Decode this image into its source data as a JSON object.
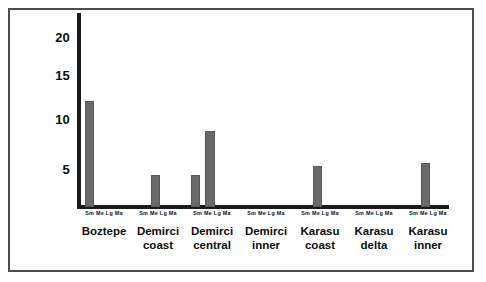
{
  "figure": {
    "background_color": "#ffffff",
    "frame_color": "#4c4c4c",
    "axis_color": "#1a1a1a",
    "bar_color": "#6a6a6a"
  },
  "axis": {
    "y_ticks": [
      "20",
      "15",
      "10",
      "5"
    ],
    "sub_tick_label": "Sm Me Lg Ma"
  },
  "chart_data": {
    "type": "bar",
    "title": "",
    "xlabel": "",
    "ylabel": "",
    "ylim": [
      0,
      22
    ],
    "grid": false,
    "legend": "none",
    "y_tick_values": [
      5,
      10,
      15,
      20
    ],
    "subcategories": [
      "Sm",
      "Me",
      "Lg",
      "Ma"
    ],
    "categories": [
      "Boztepe",
      "Demirci coast",
      "Demirci central",
      "Demirci inner",
      "Karasu coast",
      "Karasu delta",
      "Karasu inner"
    ],
    "series": [
      {
        "name": "Sm",
        "values": [
          12.5,
          0,
          3.8,
          0,
          0,
          0,
          0
        ]
      },
      {
        "name": "Me",
        "values": [
          0,
          3.8,
          9.0,
          0,
          4.8,
          0,
          5.2
        ]
      },
      {
        "name": "Lg",
        "values": [
          0,
          0,
          0,
          0,
          0,
          0,
          0
        ]
      },
      {
        "name": "Ma",
        "values": [
          0,
          0,
          0,
          0,
          0,
          0,
          0
        ]
      }
    ]
  },
  "groups": [
    {
      "label": "Boztepe",
      "label_line1": "Boztepe",
      "label_line2": "",
      "subticks": "Sm Me Lg Ma",
      "left": 77,
      "width": 54,
      "bars": [
        {
          "sub": "Sm",
          "value": 12.5,
          "x": 8,
          "w": 9
        }
      ]
    },
    {
      "label": "Demirci coast",
      "label_line1": "Demirci",
      "label_line2": "coast",
      "subticks": "Sm Me Lg Ma",
      "left": 131,
      "width": 54,
      "bars": [
        {
          "sub": "Me",
          "value": 3.8,
          "x": 20,
          "w": 9
        }
      ]
    },
    {
      "label": "Demirci central",
      "label_line1": "Demirci",
      "label_line2": "central",
      "subticks": "Sm Me Lg Ma",
      "left": 185,
      "width": 54,
      "bars": [
        {
          "sub": "Sm",
          "value": 3.8,
          "x": 6,
          "w": 9
        },
        {
          "sub": "Me",
          "value": 9.0,
          "x": 20,
          "w": 10
        }
      ]
    },
    {
      "label": "Demirci inner",
      "label_line1": "Demirci",
      "label_line2": "inner",
      "subticks": "Sm Me Lg Ma",
      "left": 239,
      "width": 54,
      "bars": []
    },
    {
      "label": "Karasu coast",
      "label_line1": "Karasu",
      "label_line2": "coast",
      "subticks": "Sm Me Lg Ma",
      "left": 293,
      "width": 54,
      "bars": [
        {
          "sub": "Me",
          "value": 4.8,
          "x": 20,
          "w": 9
        }
      ]
    },
    {
      "label": "Karasu delta",
      "label_line1": "Karasu",
      "label_line2": "delta",
      "subticks": "Sm Me Lg Ma",
      "left": 347,
      "width": 54,
      "bars": []
    },
    {
      "label": "Karasu inner",
      "label_line1": "Karasu",
      "label_line2": "inner",
      "subticks": "Sm Me Lg Ma",
      "left": 401,
      "width": 54,
      "bars": [
        {
          "sub": "Me",
          "value": 5.2,
          "x": 20,
          "w": 9
        }
      ]
    }
  ],
  "scale": {
    "baseline_y": 207,
    "px_per_unit": 8.45,
    "tick_y": {
      "20": 38,
      "15": 76,
      "10": 120,
      "5": 170
    }
  }
}
